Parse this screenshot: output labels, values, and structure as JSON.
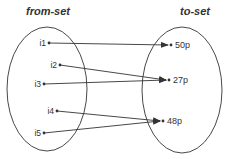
{
  "diagram": {
    "type": "mapping",
    "from_set": {
      "title": "from-set",
      "elements": [
        {
          "id": "i1",
          "label": "i1",
          "x": 49,
          "y": 43
        },
        {
          "id": "i2",
          "label": "i2",
          "x": 60,
          "y": 65
        },
        {
          "id": "i3",
          "label": "i3",
          "x": 44,
          "y": 84
        },
        {
          "id": "i4",
          "label": "i4",
          "x": 57,
          "y": 111
        },
        {
          "id": "i5",
          "label": "i5",
          "x": 44,
          "y": 133
        }
      ]
    },
    "to_set": {
      "title": "to-set",
      "elements": [
        {
          "id": "50p",
          "label": "50p",
          "x": 171,
          "y": 45
        },
        {
          "id": "27p",
          "label": "27p",
          "x": 169,
          "y": 80
        },
        {
          "id": "48p",
          "label": "48p",
          "x": 163,
          "y": 121
        }
      ]
    },
    "mappings": [
      {
        "from": "i1",
        "to": "50p"
      },
      {
        "from": "i2",
        "to": "27p"
      },
      {
        "from": "i3",
        "to": "27p"
      },
      {
        "from": "i4",
        "to": "48p"
      },
      {
        "from": "i5",
        "to": "48p"
      }
    ],
    "colors": {
      "line": "#333333",
      "background": "#ffffff"
    }
  }
}
